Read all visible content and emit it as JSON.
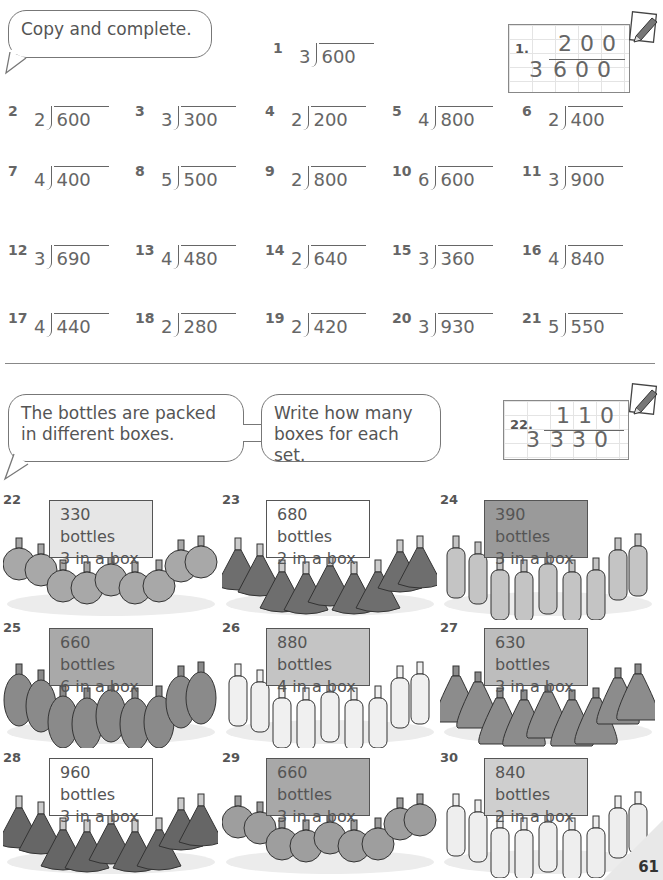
{
  "section1": {
    "instruction": "Copy and complete.",
    "problems": [
      {
        "num": "1",
        "divisor": "3",
        "dividend": "600"
      },
      {
        "num": "2",
        "divisor": "2",
        "dividend": "600"
      },
      {
        "num": "3",
        "divisor": "3",
        "dividend": "300"
      },
      {
        "num": "4",
        "divisor": "2",
        "dividend": "200"
      },
      {
        "num": "5",
        "divisor": "4",
        "dividend": "800"
      },
      {
        "num": "6",
        "divisor": "2",
        "dividend": "400"
      },
      {
        "num": "7",
        "divisor": "4",
        "dividend": "400"
      },
      {
        "num": "8",
        "divisor": "5",
        "dividend": "500"
      },
      {
        "num": "9",
        "divisor": "2",
        "dividend": "800"
      },
      {
        "num": "10",
        "divisor": "6",
        "dividend": "600"
      },
      {
        "num": "11",
        "divisor": "3",
        "dividend": "900"
      },
      {
        "num": "12",
        "divisor": "3",
        "dividend": "690"
      },
      {
        "num": "13",
        "divisor": "4",
        "dividend": "480"
      },
      {
        "num": "14",
        "divisor": "2",
        "dividend": "640"
      },
      {
        "num": "15",
        "divisor": "3",
        "dividend": "360"
      },
      {
        "num": "16",
        "divisor": "4",
        "dividend": "840"
      },
      {
        "num": "17",
        "divisor": "4",
        "dividend": "440"
      },
      {
        "num": "18",
        "divisor": "2",
        "dividend": "280"
      },
      {
        "num": "19",
        "divisor": "2",
        "dividend": "420"
      },
      {
        "num": "20",
        "divisor": "3",
        "dividend": "930"
      },
      {
        "num": "21",
        "divisor": "5",
        "dividend": "550"
      }
    ],
    "example": {
      "label": "1.",
      "quotient": "200",
      "divisor": "3",
      "dividend": "600"
    }
  },
  "section2": {
    "instruction_left": "The bottles are packed in different boxes.",
    "instruction_right": "Write how many boxes for each set.",
    "example": {
      "label": "22.",
      "quotient": "110",
      "divisor": "3",
      "dividend": "330"
    },
    "sets": [
      {
        "num": "22",
        "line1": "330 bottles",
        "line2": "3 in a box",
        "shape": "round",
        "sign": "#e6e6e6",
        "bottle": "#a8a8a8"
      },
      {
        "num": "23",
        "line1": "680 bottles",
        "line2": "2 in a box",
        "shape": "cone",
        "sign": "#ffffff",
        "bottle": "#6e6e6e"
      },
      {
        "num": "24",
        "line1": "390 bottles",
        "line2": "3 in a box",
        "shape": "tall",
        "sign": "#9a9a9a",
        "bottle": "#c4c4c4"
      },
      {
        "num": "25",
        "line1": "660 bottles",
        "line2": "6 in a box",
        "shape": "oval",
        "sign": "#a9a9a9",
        "bottle": "#8a8a8a"
      },
      {
        "num": "26",
        "line1": "880 bottles",
        "line2": "4 in a box",
        "shape": "tall",
        "sign": "#c4c4c4",
        "bottle": "#f0f0f0"
      },
      {
        "num": "27",
        "line1": "630 bottles",
        "line2": "3 in a box",
        "shape": "dome",
        "sign": "#bdbdbd",
        "bottle": "#8c8c8c"
      },
      {
        "num": "28",
        "line1": "960 bottles",
        "line2": "3 in a box",
        "shape": "cone",
        "sign": "#ffffff",
        "bottle": "#666666"
      },
      {
        "num": "29",
        "line1": "660 bottles",
        "line2": "3 in a box",
        "shape": "round",
        "sign": "#a8a8a8",
        "bottle": "#9e9e9e"
      },
      {
        "num": "30",
        "line1": "840 bottles",
        "line2": "2 in a box",
        "shape": "tall",
        "sign": "#cfcfcf",
        "bottle": "#eeeeee"
      }
    ]
  },
  "page_number": "61"
}
